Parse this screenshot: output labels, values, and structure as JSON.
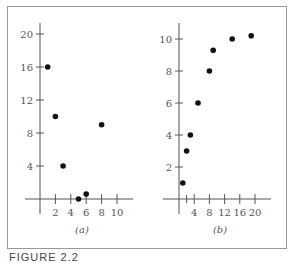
{
  "figure": {
    "caption": "FIGURE 2.2",
    "frame_color": "#999999",
    "axis_color": "#555555",
    "point_color": "#111111"
  },
  "chart_data": [
    {
      "type": "scatter",
      "label": "(a)",
      "title": "",
      "xlabel": "",
      "ylabel": "",
      "xlim": [
        0,
        11
      ],
      "ylim": [
        0,
        21
      ],
      "xticks": [
        2,
        4,
        6,
        8,
        10
      ],
      "yticks": [
        4,
        8,
        12,
        16,
        20
      ],
      "grid": false,
      "points": [
        {
          "x": 1,
          "y": 16
        },
        {
          "x": 2,
          "y": 10
        },
        {
          "x": 3,
          "y": 4
        },
        {
          "x": 5,
          "y": 0
        },
        {
          "x": 6,
          "y": 0.6
        },
        {
          "x": 8,
          "y": 9
        }
      ]
    },
    {
      "type": "scatter",
      "label": "(b)",
      "title": "",
      "xlabel": "",
      "ylabel": "",
      "xlim": [
        0,
        22
      ],
      "ylim": [
        0,
        11
      ],
      "xticks": [
        4,
        8,
        12,
        16,
        20
      ],
      "minor_xticks": [
        2
      ],
      "yticks": [
        2,
        4,
        6,
        8,
        10
      ],
      "grid": false,
      "points": [
        {
          "x": 1,
          "y": 1
        },
        {
          "x": 2,
          "y": 3
        },
        {
          "x": 3,
          "y": 4
        },
        {
          "x": 5,
          "y": 6
        },
        {
          "x": 8,
          "y": 8
        },
        {
          "x": 9,
          "y": 9.3
        },
        {
          "x": 14,
          "y": 10
        },
        {
          "x": 19,
          "y": 10.2
        }
      ]
    }
  ]
}
